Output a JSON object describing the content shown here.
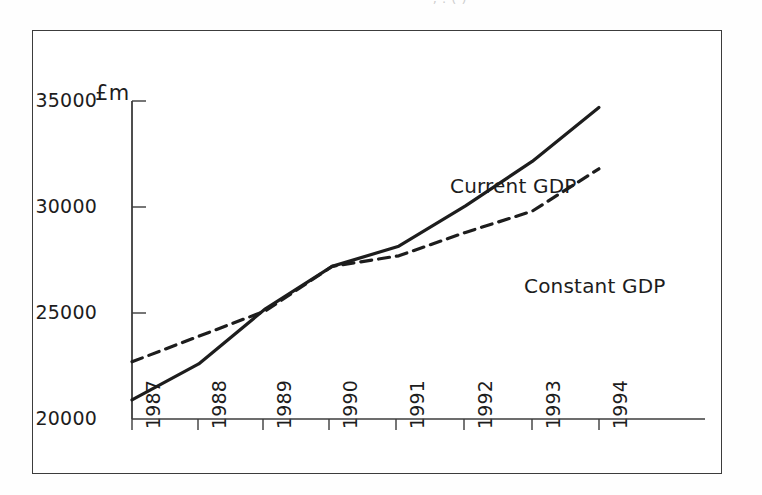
{
  "figure": {
    "unit_label": "£m",
    "caption_fragment": ", .  (      )"
  },
  "chart_data": {
    "type": "line",
    "title": "",
    "xlabel": "",
    "ylabel": "£m",
    "categories": [
      "1987",
      "1988",
      "1989",
      "1990",
      "1991",
      "1992",
      "1993",
      "1994"
    ],
    "x": [
      1987,
      1988,
      1989,
      1990,
      1991,
      1992,
      1993,
      1994
    ],
    "series": [
      {
        "name": "Current GDP",
        "style": "solid",
        "color": "#1d1d1d",
        "values": [
          20900,
          22600,
          25200,
          27200,
          28150,
          30050,
          32150,
          34700
        ]
      },
      {
        "name": "Constant GDP",
        "style": "dashed",
        "color": "#1d1d1d",
        "values": [
          22700,
          23900,
          25100,
          27200,
          27700,
          28800,
          29800,
          31800
        ]
      }
    ],
    "ylim": [
      20000,
      35000
    ],
    "yticks": [
      20000,
      25000,
      30000,
      35000
    ],
    "ytick_labels": [
      "20000",
      "25000",
      "30000",
      "35000"
    ],
    "xtick_labels": [
      "1987",
      "1988",
      "1989",
      "1990",
      "1991",
      "1992",
      "1993",
      "1994"
    ],
    "grid": false,
    "legend": "inline-annotations",
    "annotations": [
      {
        "text": "Current GDP",
        "near_series": "Current GDP"
      },
      {
        "text": "Constant GDP",
        "near_series": "Constant GDP"
      }
    ]
  },
  "axes": {
    "y_labels": [
      "35000",
      "30000",
      "25000",
      "20000"
    ],
    "x_labels": [
      "1987",
      "1988",
      "1989",
      "1990",
      "1991",
      "1992",
      "1993",
      "1994"
    ]
  }
}
